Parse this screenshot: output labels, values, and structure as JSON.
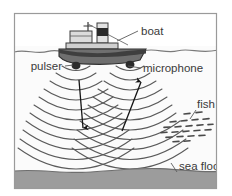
{
  "figure": {
    "frame": {
      "border_color": "#9a9a9a",
      "background": "#ffffff"
    },
    "labels": {
      "boat": "boat",
      "pulser": "pulser",
      "microphone": "microphone",
      "fish": "fish",
      "sea_floor": "sea floor"
    },
    "colors": {
      "sky": "#ffffff",
      "water": "#fbfbfb",
      "sea_floor_band": "#9c9c9c",
      "sea_floor_edge": "#6e6e6e",
      "wave_arc": "#5a5a5a",
      "arrow": "#141414",
      "hull_dark": "#4e4e4e",
      "hull_mid": "#6f6f6f",
      "cabin_light": "#dcdcdc",
      "funnel_dark": "#2a2a2a",
      "transducer": "#2b2b2b",
      "fish_mark": "#4a4a4a",
      "label_text": "#3a3a3a",
      "leader_line": "#5a5a5a",
      "water_line": "#7a7a7a"
    },
    "elements": {
      "boat_description": "tugboat with cabin, mast and funnel floating on the water surface",
      "pulser_description": "dark transducer hanging below the bow emitting sound pulses",
      "microphone_description": "dark transducer hanging below the stern receiving returning echoes",
      "down_arrow_description": "arrow showing outgoing sound pulse travelling down",
      "up_arrow_description": "arrow showing reflected echo travelling up to the microphone",
      "wave_description": "concentric arcs representing sound waves spreading through the water",
      "fish_description": "shoal of small dash marks representing fish in the water",
      "sea_floor_description": "grey band across the bottom representing the sea bed"
    },
    "counts": {
      "pulser_arcs": 11,
      "microphone_arcs": 11,
      "fish_marks": 22
    }
  }
}
